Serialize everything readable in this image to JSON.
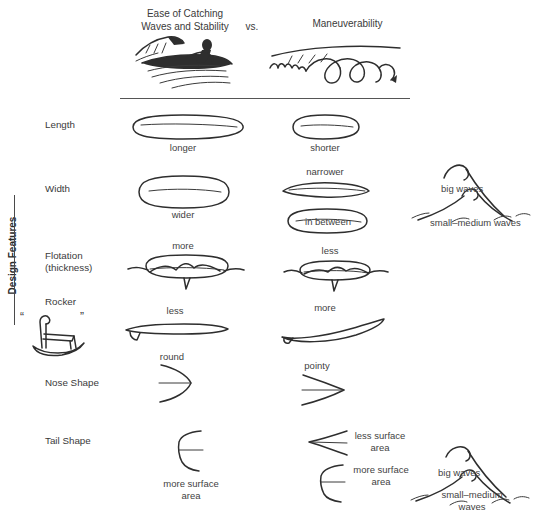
{
  "header": {
    "left_title_line1": "Ease of Catching",
    "left_title_line2": "Waves and Stability",
    "vs": "vs.",
    "right_title": "Maneuverability",
    "left_illustration": "surfer-riding-wave-icon",
    "right_illustration": "winding-path-arrow-icon"
  },
  "axis": {
    "vertical_label": "Design Features"
  },
  "rows": [
    {
      "id": "length",
      "label": "Length",
      "left_caption": "longer",
      "right_caption": "shorter",
      "left_icon": "long-surfboard-outline-icon",
      "right_icon": "short-surfboard-outline-icon"
    },
    {
      "id": "width",
      "label": "Width",
      "left_caption": "wider",
      "right_caption": "narrower",
      "right_caption2": "in between",
      "left_icon": "wide-surfboard-outline-icon",
      "right_icon": "narrow-surfboard-outline-icon",
      "right_icon2": "medium-surfboard-outline-icon"
    },
    {
      "id": "flotation",
      "label": "Flotation",
      "label2": "(thickness)",
      "left_caption": "more",
      "right_caption": "less",
      "left_icon": "thick-board-floating-icon",
      "right_icon": "thin-board-floating-icon"
    },
    {
      "id": "rocker",
      "label": "Rocker",
      "left_caption": "less",
      "right_caption": "more",
      "left_icon": "flat-board-profile-icon",
      "right_icon": "curved-board-profile-icon",
      "side_icon": "rocking-chair-icon",
      "quote_left": "“",
      "quote_right": "”"
    },
    {
      "id": "nose-shape",
      "label": "Nose Shape",
      "left_caption": "round",
      "right_caption": "pointy",
      "left_icon": "round-nose-icon",
      "right_icon": "pointy-nose-icon"
    },
    {
      "id": "tail-shape",
      "label": "Tail Shape",
      "left_caption": "more surface\narea",
      "left_caption_line1": "more surface",
      "left_caption_line2": "area",
      "right_caption1_line1": "less surface",
      "right_caption1_line2": "area",
      "right_caption2_line1": "more surface",
      "right_caption2_line2": "area",
      "left_icon": "square-tail-icon",
      "right_icon1": "swallow-tail-icon",
      "right_icon2": "square-tail-icon"
    }
  ],
  "wave_annotations": [
    {
      "id": "wave-upper",
      "icon": "wave-icon",
      "big_label": "big waves",
      "small_label": "small–medium waves"
    },
    {
      "id": "wave-lower",
      "icon": "wave-icon",
      "big_label": "big waves",
      "small_label_line1": "small–medium",
      "small_label_line2": "waves"
    }
  ],
  "colors": {
    "ink": "#2e2e2e",
    "text": "#3a3a3a",
    "background": "#ffffff"
  }
}
